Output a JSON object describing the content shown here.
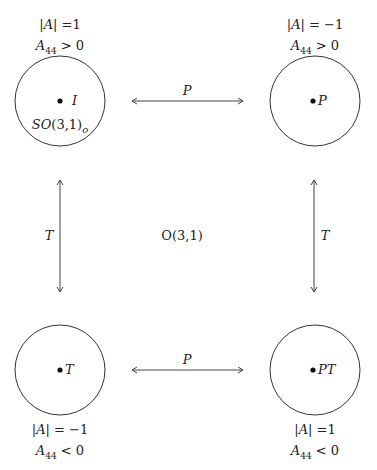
{
  "diagram": {
    "center_label": "O(3,1)",
    "components": [
      {
        "id": "identity",
        "point_label": "I",
        "sublabel": "SO(3,1)o",
        "det": "|A| =1",
        "a44": "A44 > 0"
      },
      {
        "id": "parity",
        "point_label": "P",
        "det": "|A| = −1",
        "a44": "A44 > 0"
      },
      {
        "id": "time",
        "point_label": "T",
        "det": "|A| = −1",
        "a44": "A44 < 0"
      },
      {
        "id": "parity-time",
        "point_label": "PT",
        "det": "|A| =1",
        "a44": "A44 < 0"
      }
    ],
    "arrows": {
      "top": "P",
      "bottom": "P",
      "left": "T",
      "right": "T"
    }
  }
}
